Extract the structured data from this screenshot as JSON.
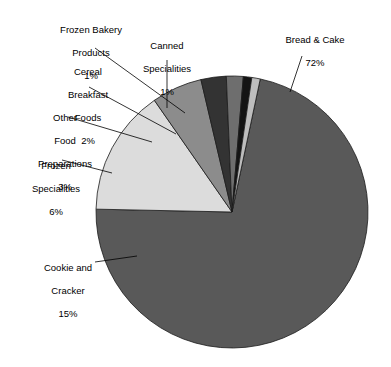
{
  "chart_data": {
    "type": "pie",
    "title": "",
    "subtitle": "",
    "xlabel": "",
    "ylabel": "",
    "legend_position": "callout-labels",
    "grid": false,
    "units": "percent",
    "categories": [
      "Bread & Cake",
      "Cookie and Cracker",
      "Frozen Specialities",
      "Other Food Preparations",
      "Cereal Breakfast Foods",
      "Frozen Bakery Products",
      "Canned Specialities"
    ],
    "values": [
      72,
      15,
      6,
      3,
      2,
      1,
      1
    ],
    "slices": [
      {
        "name": "Bread & Cake",
        "label_lines": [
          "Bread & Cake"
        ],
        "value": 72,
        "value_label": "72%",
        "color": "#595959",
        "start_angle": -78,
        "end_angle": 181.2
      },
      {
        "name": "Cookie and Cracker",
        "label_lines": [
          "Cookie and",
          "Cracker"
        ],
        "value": 15,
        "value_label": "15%",
        "color": "#dcdcdc",
        "start_angle": 181.2,
        "end_angle": 235.2
      },
      {
        "name": "Frozen Specialities",
        "label_lines": [
          "Frozen",
          "Specialities"
        ],
        "value": 6,
        "value_label": "6%",
        "color": "#8c8c8c",
        "start_angle": 235.2,
        "end_angle": 256.8
      },
      {
        "name": "Other Food Preparations",
        "label_lines": [
          "Other",
          "Food",
          "Preparations"
        ],
        "value": 3,
        "value_label": "3%",
        "color": "#333333",
        "start_angle": 256.8,
        "end_angle": 267.6
      },
      {
        "name": "Cereal Breakfast Foods",
        "label_lines": [
          "Cereal",
          "Breakfast",
          "Foods"
        ],
        "value": 2,
        "value_label": "2%",
        "color": "#6e6e6e",
        "start_angle": 267.6,
        "end_angle": 274.8
      },
      {
        "name": "Frozen Bakery Products",
        "label_lines": [
          "Frozen Bakery",
          "Products"
        ],
        "value": 1,
        "value_label": "1%",
        "color": "#141414",
        "start_angle": 274.8,
        "end_angle": 278.4
      },
      {
        "name": "Canned Specialities",
        "label_lines": [
          "Canned",
          "Specialities"
        ],
        "value": 1,
        "value_label": "1%",
        "color": "#bdbdbd",
        "start_angle": 278.4,
        "end_angle": 282
      }
    ],
    "geometry": {
      "center_x": 232,
      "center_y": 212,
      "radius": 136,
      "stroke_color": "#1a1a1a",
      "stroke_width": 0.8
    },
    "background_color": "#ffffff",
    "text_color": "#000000"
  },
  "labels": {
    "frozen_bakery": {
      "line1": "Frozen Bakery",
      "line2": "Products",
      "pct": "1%"
    },
    "canned": {
      "line1": "Canned",
      "line2": "Specialities",
      "pct": "1%"
    },
    "cereal": {
      "line1": "Cereal",
      "line2": "Breakfast",
      "line3": "Foods",
      "pct": "2%"
    },
    "other_food": {
      "line1": "Other",
      "line2": "Food",
      "line3": "Preparations",
      "pct": "3%"
    },
    "frozen_spec": {
      "line1": "Frozen",
      "line2": "Specialities",
      "pct": "6%"
    },
    "cookie": {
      "line1": "Cookie and",
      "line2": "Cracker",
      "pct": "15%"
    },
    "bread": {
      "line1": "Bread & Cake",
      "pct": "72%"
    }
  }
}
